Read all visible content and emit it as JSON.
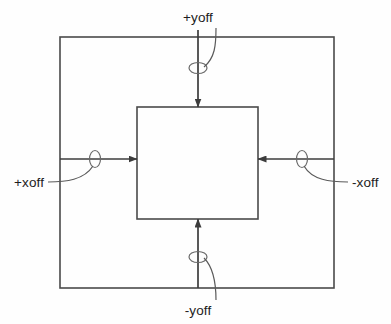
{
  "diagram": {
    "background_color": "#fefefe",
    "stroke_color": "#4a4a4a",
    "arrow_color": "#3c3c3c",
    "leader_color": "#5a5a5a",
    "text_color": "#1d1d1d",
    "outer_rect": {
      "name": "outer-boundary-rectangle",
      "x": 60,
      "y": 37,
      "width": 274,
      "height": 251
    },
    "inner_rect": {
      "name": "inner-content-rectangle",
      "x": 137,
      "y": 107,
      "width": 121,
      "height": 112
    },
    "labels": {
      "top": "+yoff",
      "left": "+xoff",
      "right": "-xoff",
      "bottom": "-yoff"
    },
    "arrows": [
      {
        "name": "top-offset-arrow",
        "label": "+yoff",
        "direction": "down",
        "from": [
          198,
          30
        ],
        "to": [
          198,
          107
        ]
      },
      {
        "name": "left-offset-arrow",
        "label": "+xoff",
        "direction": "right",
        "from": [
          60,
          159
        ],
        "to": [
          137,
          159
        ]
      },
      {
        "name": "right-offset-arrow",
        "label": "-xoff",
        "direction": "left",
        "from": [
          334,
          159
        ],
        "to": [
          258,
          159
        ]
      },
      {
        "name": "bottom-offset-arrow",
        "label": "-yoff",
        "direction": "up",
        "from": [
          198,
          288
        ],
        "to": [
          198,
          219
        ]
      }
    ],
    "markers": [
      {
        "name": "top-marker-ellipse",
        "cx": 198,
        "cy": 68,
        "rx": 9,
        "ry": 5.5
      },
      {
        "name": "left-marker-ellipse",
        "cx": 95,
        "cy": 159,
        "rx": 5.5,
        "ry": 8.5
      },
      {
        "name": "right-marker-ellipse",
        "cx": 302,
        "cy": 159,
        "rx": 5.5,
        "ry": 8.5
      },
      {
        "name": "bottom-marker-ellipse",
        "cx": 198,
        "cy": 257,
        "rx": 9,
        "ry": 5.5
      }
    ]
  }
}
